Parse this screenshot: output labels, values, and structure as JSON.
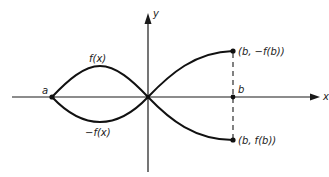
{
  "diagram": {
    "axes": {
      "x_label": "x",
      "y_label": "y"
    },
    "points": {
      "a_label": "a",
      "b_label": "b",
      "upper_point_label": "(b, −f(b))",
      "lower_point_label": "(b, f(b))"
    },
    "curves": {
      "upper_label": "f(x)",
      "lower_label": "−f(x)"
    },
    "colors": {
      "ink": "#111111",
      "background": "#ffffff"
    }
  }
}
